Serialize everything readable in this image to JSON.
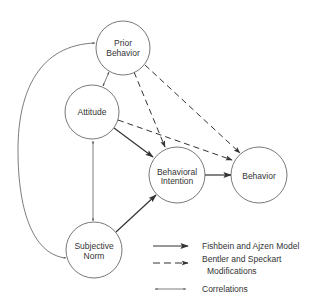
{
  "diagram": {
    "type": "path-model",
    "nodes": [
      {
        "id": "prior_behavior",
        "lines": [
          "Prior",
          "Behavior"
        ],
        "cx": 123,
        "cy": 48,
        "r": 27
      },
      {
        "id": "attitude",
        "lines": [
          "Attitude"
        ],
        "cx": 92,
        "cy": 112,
        "r": 27
      },
      {
        "id": "behavioral_intention",
        "lines": [
          "Behavioral",
          "Intention"
        ],
        "cx": 177,
        "cy": 175,
        "r": 28
      },
      {
        "id": "behavior",
        "lines": [
          "Behavior"
        ],
        "cx": 259,
        "cy": 175,
        "r": 28
      },
      {
        "id": "subjective_norm",
        "lines": [
          "Subjective",
          "Norm"
        ],
        "cx": 94,
        "cy": 250,
        "r": 28
      }
    ],
    "edges": [
      {
        "from": "attitude",
        "to": "behavioral_intention",
        "style": "solid"
      },
      {
        "from": "subjective_norm",
        "to": "behavioral_intention",
        "style": "solid"
      },
      {
        "from": "behavioral_intention",
        "to": "behavior",
        "style": "solid"
      },
      {
        "from": "prior_behavior",
        "to": "behavioral_intention",
        "style": "dashed"
      },
      {
        "from": "prior_behavior",
        "to": "behavior",
        "style": "dashed"
      },
      {
        "from": "attitude",
        "to": "behavior",
        "style": "dashed"
      },
      {
        "from": "prior_behavior",
        "to": "attitude",
        "style": "correlation"
      },
      {
        "from": "attitude",
        "to": "subjective_norm",
        "style": "correlation"
      },
      {
        "from": "prior_behavior",
        "to": "subjective_norm",
        "style": "correlation"
      }
    ]
  },
  "legend": {
    "solid": {
      "lines": [
        "Fishbein and Ajzen Model"
      ]
    },
    "dashed": {
      "lines": [
        "Bentler and Speckart",
        "Modifications"
      ]
    },
    "correlation": {
      "lines": [
        "Correlations"
      ]
    }
  },
  "colors": {
    "stroke": "#333333",
    "text": "#333333",
    "background": "#ffffff"
  }
}
